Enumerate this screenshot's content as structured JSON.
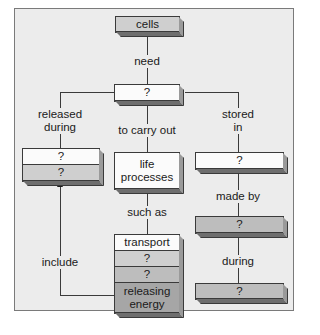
{
  "diagram": {
    "type": "concept-map",
    "nodes": {
      "cells": "cells",
      "center_unknown": "?",
      "left_top": "?",
      "left_bottom": "?",
      "life_processes": "life processes",
      "right_top": "?",
      "right_middle": "?",
      "right_bottom": "?",
      "stack_transport": "transport",
      "stack_q1": "?",
      "stack_q2": "?",
      "stack_releasing": "releasing energy"
    },
    "links": {
      "need": "need",
      "released_during": "released during",
      "to_carry_out": "to carry out",
      "stored_in": "stored in",
      "such_as": "such as",
      "made_by": "made by",
      "during": "during",
      "include": "include"
    },
    "colors": {
      "frame_bg": "#ececec",
      "white_box": "#fbfbfb",
      "light_gray_box": "#cfcfcf",
      "mid_gray_box": "#bdbdbd",
      "dark_gray_box": "#a6a6a6",
      "line": "#3a3a3a"
    }
  }
}
